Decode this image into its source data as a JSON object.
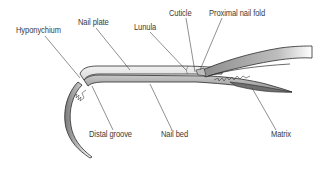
{
  "diagram": {
    "colors": {
      "background": "#ffffff",
      "outline": "#2b2b2b",
      "fill_dark": "#8e8e8e",
      "fill_light": "#e6e6e6",
      "label_text": "#3a3a3a",
      "leader_line": "#444444"
    },
    "labels": [
      {
        "id": "hyponychium",
        "text": "Hyponychium"
      },
      {
        "id": "nail-plate",
        "text": "Nail plate"
      },
      {
        "id": "lunula",
        "text": "Lunula"
      },
      {
        "id": "cuticle",
        "text": "Cuticle"
      },
      {
        "id": "proximal-nail-fold",
        "text": "Proximal nail fold"
      },
      {
        "id": "distal-groove",
        "text": "Distal groove"
      },
      {
        "id": "nail-bed",
        "text": "Nail bed"
      },
      {
        "id": "matrix",
        "text": "Matrix"
      }
    ]
  }
}
